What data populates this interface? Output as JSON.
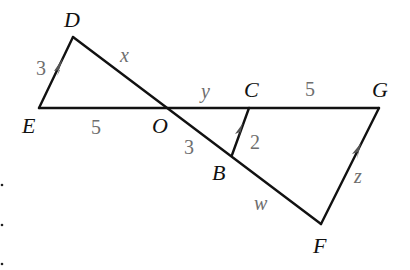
{
  "diagram": {
    "type": "geometry-figure",
    "points": {
      "D": {
        "label": "D",
        "x": 73,
        "y": 37
      },
      "E": {
        "label": "E",
        "x": 39,
        "y": 108
      },
      "O": {
        "label": "O",
        "x": 168,
        "y": 108
      },
      "C": {
        "label": "C",
        "x": 249,
        "y": 108
      },
      "G": {
        "label": "G",
        "x": 379,
        "y": 108
      },
      "B": {
        "label": "B",
        "x": 232,
        "y": 155
      },
      "F": {
        "label": "F",
        "x": 321,
        "y": 224
      }
    },
    "segments": [
      {
        "from": "E",
        "to": "D",
        "label": "3",
        "parallel_arrow": true
      },
      {
        "from": "D",
        "to": "O",
        "label": "x"
      },
      {
        "from": "E",
        "to": "O",
        "label": "5"
      },
      {
        "from": "O",
        "to": "C",
        "label": "y"
      },
      {
        "from": "C",
        "to": "G",
        "label": "5"
      },
      {
        "from": "O",
        "to": "B",
        "label": "3"
      },
      {
        "from": "B",
        "to": "C",
        "label": "2",
        "parallel_arrow": true
      },
      {
        "from": "B",
        "to": "F",
        "label": "w"
      },
      {
        "from": "F",
        "to": "G",
        "label": "z",
        "parallel_arrow": true
      }
    ],
    "labels": {
      "D": "D",
      "E": "E",
      "O": "O",
      "C": "C",
      "G": "G",
      "B": "B",
      "F": "F",
      "ED": "3",
      "DO": "x",
      "EO": "5",
      "OC": "y",
      "CG": "5",
      "OB": "3",
      "BC": "2",
      "BF": "w",
      "FG": "z"
    },
    "colors": {
      "line": "#111111",
      "point_label": "#111111",
      "side_label": "#6e6e6e",
      "arrow": "#555555"
    }
  }
}
